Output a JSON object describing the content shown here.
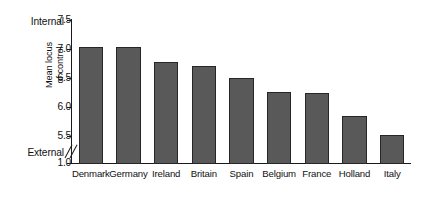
{
  "chart_data": {
    "type": "bar",
    "title": "",
    "xlabel": "",
    "ylabel": "Mean locus of control",
    "ylabel_line1": "Mean locus",
    "ylabel_line2": "of control",
    "categories": [
      "Denmark",
      "Germany",
      "Ireland",
      "Britain",
      "Spain",
      "Belgium",
      "France",
      "Holland",
      "Italy"
    ],
    "values": [
      7.03,
      7.04,
      6.78,
      6.71,
      6.5,
      6.26,
      6.25,
      5.84,
      5.52
    ],
    "series": [
      {
        "name": "Mean locus of control",
        "values": [
          7.03,
          7.04,
          6.78,
          6.71,
          6.5,
          6.26,
          6.25,
          5.84,
          5.52
        ]
      }
    ],
    "ylim": [
      1.0,
      7.5
    ],
    "yticks": [
      "7.5",
      "7.0",
      "6.5",
      "6.0",
      "5.5",
      "1.0"
    ],
    "ytick_values": [
      7.5,
      7.0,
      6.5,
      6.0,
      5.5,
      1.0
    ],
    "axis_break": true,
    "axis_break_between": [
      1.0,
      5.5
    ],
    "grid": false,
    "legend": "none",
    "annotations": {
      "top_anchor": "Internal",
      "bottom_anchor": "External"
    },
    "bar_color": "#595959",
    "bar_edge_color": "#262626",
    "axis_color": "#1a1a1a",
    "background": "#ffffff"
  }
}
